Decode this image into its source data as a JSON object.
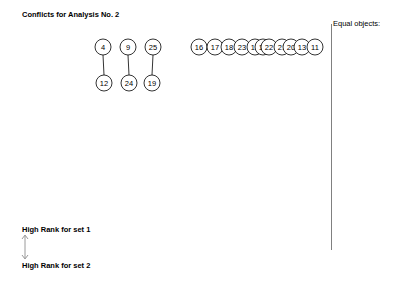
{
  "title": "Conflicts for Analysis No. 2",
  "equal_objects_label": "Equal objects:",
  "legend": {
    "top_label": "High Rank for set 1",
    "bottom_label": "High Rank for set 2",
    "arrow_icon": "double-arrow-vertical"
  },
  "conflict_pairs": [
    {
      "top": "4",
      "bottom": "12"
    },
    {
      "top": "9",
      "bottom": "24"
    },
    {
      "top": "25",
      "bottom": "19"
    }
  ],
  "single_nodes": [
    "16",
    "17",
    "18",
    "23",
    "15",
    "14",
    "22",
    "21",
    "20",
    "13",
    "11"
  ]
}
